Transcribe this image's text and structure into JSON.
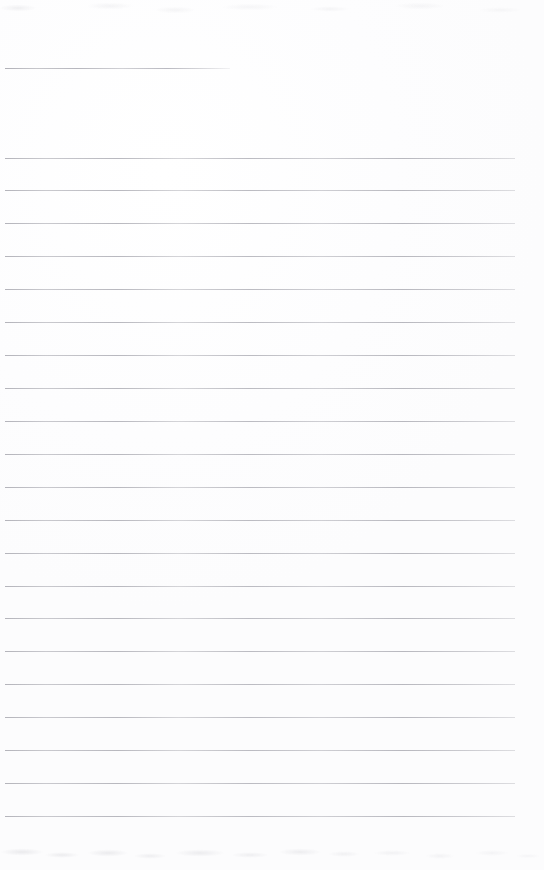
{
  "document": {
    "kind": "scanned-ruled-page",
    "title": "",
    "body_text": "",
    "page_width": 544,
    "page_height": 870,
    "background_color": "#fefefe",
    "rule_color": "#b0b0b7",
    "rule_thickness_px": 1,
    "rule_left_x": 5,
    "rule_right_x": 515,
    "rule_spacing_px": 32.7,
    "total_rules": 22,
    "notes_visible": "none",
    "handwriting_visible": "none"
  },
  "artifacts": {
    "top_smudge_label": "",
    "bottom_bleedthrough_label": ""
  },
  "rules": [
    {
      "id": "rule-01",
      "y": 68,
      "x": 5,
      "width": 225,
      "partial": true
    },
    {
      "id": "rule-02",
      "y": 158,
      "x": 5,
      "width": 510,
      "partial": false
    },
    {
      "id": "rule-03",
      "y": 190,
      "x": 5,
      "width": 510,
      "partial": false
    },
    {
      "id": "rule-04",
      "y": 223,
      "x": 5,
      "width": 510,
      "partial": false
    },
    {
      "id": "rule-05",
      "y": 256,
      "x": 5,
      "width": 510,
      "partial": false
    },
    {
      "id": "rule-06",
      "y": 289,
      "x": 5,
      "width": 510,
      "partial": false
    },
    {
      "id": "rule-07",
      "y": 322,
      "x": 5,
      "width": 510,
      "partial": false
    },
    {
      "id": "rule-08",
      "y": 355,
      "x": 5,
      "width": 510,
      "partial": false
    },
    {
      "id": "rule-09",
      "y": 388,
      "x": 5,
      "width": 510,
      "partial": false
    },
    {
      "id": "rule-10",
      "y": 421,
      "x": 5,
      "width": 510,
      "partial": false
    },
    {
      "id": "rule-11",
      "y": 454,
      "x": 5,
      "width": 510,
      "partial": false
    },
    {
      "id": "rule-12",
      "y": 487,
      "x": 5,
      "width": 510,
      "partial": false
    },
    {
      "id": "rule-13",
      "y": 520,
      "x": 5,
      "width": 510,
      "partial": false
    },
    {
      "id": "rule-14",
      "y": 553,
      "x": 5,
      "width": 510,
      "partial": false
    },
    {
      "id": "rule-15",
      "y": 586,
      "x": 5,
      "width": 510,
      "partial": false
    },
    {
      "id": "rule-16",
      "y": 618,
      "x": 5,
      "width": 510,
      "partial": false
    },
    {
      "id": "rule-17",
      "y": 651,
      "x": 5,
      "width": 510,
      "partial": false
    },
    {
      "id": "rule-18",
      "y": 684,
      "x": 5,
      "width": 510,
      "partial": false
    },
    {
      "id": "rule-19",
      "y": 717,
      "x": 5,
      "width": 510,
      "partial": false
    },
    {
      "id": "rule-20",
      "y": 750,
      "x": 5,
      "width": 510,
      "partial": false
    },
    {
      "id": "rule-21",
      "y": 783,
      "x": 5,
      "width": 510,
      "partial": false
    },
    {
      "id": "rule-22",
      "y": 816,
      "x": 5,
      "width": 510,
      "partial": false
    }
  ]
}
